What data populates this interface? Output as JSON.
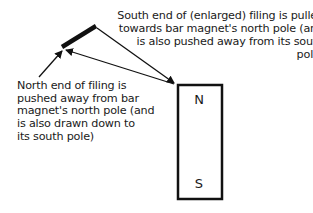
{
  "diagram": {
    "top_annotation": "South end of (enlarged) filing is pulled\n  towards bar magnet's north pole (and\n    is also pushed away from its south\n  pole)",
    "bottom_annotation": "North end of filing is\npushed away from bar\nmagnet's north pole (and\nis also drawn down to\nits south pole)",
    "magnet": {
      "north_label": "N",
      "south_label": "S"
    },
    "colors": {
      "stroke": "#111111",
      "background": "#ffffff"
    }
  }
}
